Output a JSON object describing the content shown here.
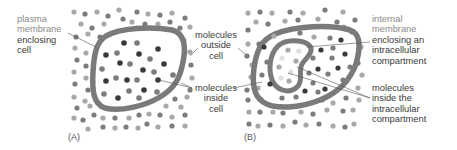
{
  "panels": [
    {
      "id": "A",
      "tag": "(A)",
      "labels": {
        "plasma_membrane_line1": "plasma",
        "plasma_membrane_line2": "membrane",
        "plasma_membrane_line3": "enclosing",
        "plasma_membrane_line4": "cell",
        "outside_line1": "molecules",
        "outside_line2": "outside",
        "outside_line3": "cell",
        "inside_line1": "molecules",
        "inside_line2": "inside",
        "inside_line3": "cell"
      }
    },
    {
      "id": "B",
      "tag": "(B)",
      "labels": {
        "internal_line1": "internal",
        "internal_line2": "membrane",
        "internal_line3": "enclosing an",
        "internal_line4": "intracellular",
        "internal_line5": "compartment",
        "compartment_line1": "molecules",
        "compartment_line2": "inside the",
        "compartment_line3": "intracellular",
        "compartment_line4": "compartment"
      }
    }
  ],
  "colors": {
    "membrane": "#7a7a7a",
    "dark_molecule": "#3a3a3a",
    "mid_molecule": "#7c7c7c",
    "light_molecule": "#a8a8a8",
    "pale_molecule": "#e0e0e0",
    "label_text": "#3a3a3a",
    "label_gray": "#8a8a8a"
  }
}
